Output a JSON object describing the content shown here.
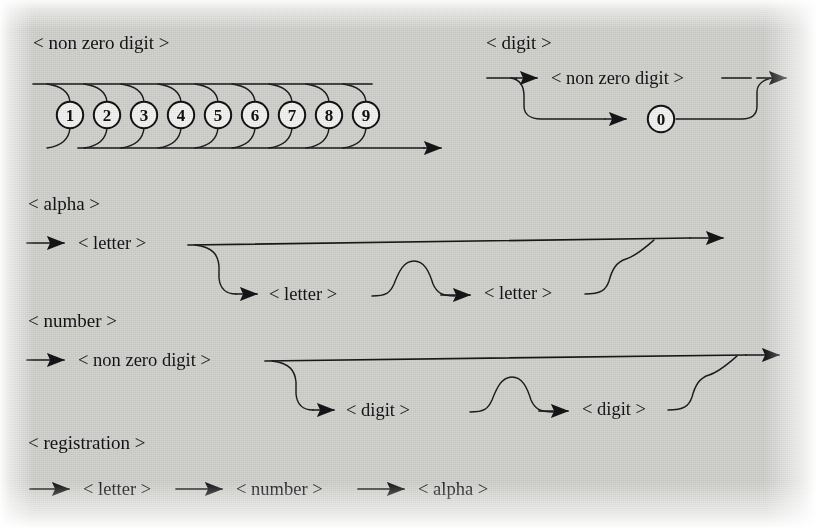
{
  "figure": {
    "kind": "syntax-railroad-diagrams",
    "background_color": "#d3d3d0",
    "ink_color": "#141517"
  },
  "sections": [
    {
      "id": "non-zero-digit",
      "title": "< non zero digit >",
      "alternatives": [
        "1",
        "2",
        "3",
        "4",
        "5",
        "6",
        "7",
        "8",
        "9"
      ]
    },
    {
      "id": "digit",
      "title": "< digit >",
      "branch_top": "< non zero digit >",
      "branch_bottom": "0"
    },
    {
      "id": "alpha",
      "title": "< alpha >",
      "first": "< letter >",
      "optional_one": "< letter >",
      "optional_two": "< letter >"
    },
    {
      "id": "number",
      "title": "< number >",
      "first": "< non zero digit >",
      "optional_one": "< digit >",
      "optional_two": "< digit >"
    },
    {
      "id": "registration",
      "title": "< registration >",
      "sequence": [
        "< letter >",
        "< number >",
        "< alpha >"
      ]
    }
  ]
}
